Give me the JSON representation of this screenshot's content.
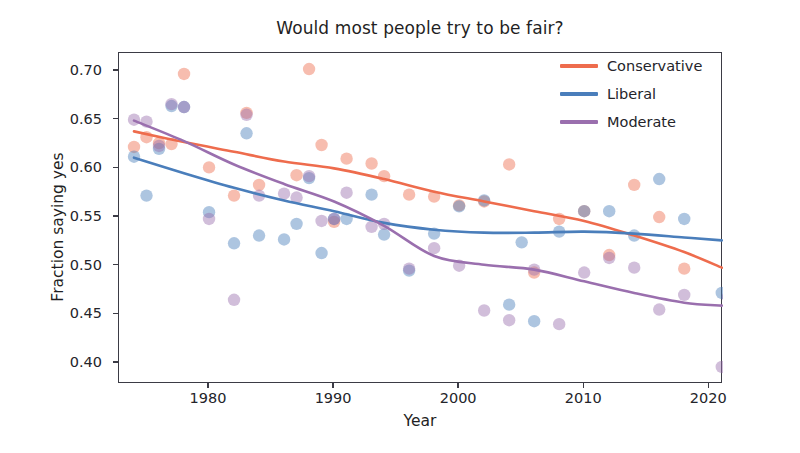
{
  "chart_data": {
    "type": "scatter",
    "title": "Would most people try to be fair?",
    "xlabel": "Year",
    "ylabel": "Fraction saying yes",
    "xlim": [
      1972.8,
      11.0
    ],
    "x_range": [
      1972.8,
      2021.1
    ],
    "ylim": [
      0.3785,
      0.7185
    ],
    "grid": false,
    "legend_position": "upper right",
    "xticks": [
      1980,
      1990,
      2000,
      2010,
      2020
    ],
    "xtick_labels": [
      "1980",
      "1990",
      "2000",
      "2010",
      "2020"
    ],
    "yticks": [
      0.4,
      0.45,
      0.5,
      0.55,
      0.6,
      0.65,
      0.7
    ],
    "ytick_labels": [
      "0.40",
      "0.45",
      "0.50",
      "0.55",
      "0.60",
      "0.65",
      "0.70"
    ],
    "colors": {
      "Conservative": "#ee6c4d",
      "Liberal": "#4a7ebb",
      "Moderate": "#9a6fae"
    },
    "marker_opacity": 0.45,
    "series": [
      {
        "name": "Conservative",
        "color": "#ee6c4d",
        "points": [
          [
            1974,
            0.622
          ],
          [
            1975,
            0.632
          ],
          [
            1976,
            0.626
          ],
          [
            1977,
            0.625
          ],
          [
            1978,
            0.697
          ],
          [
            1980,
            0.601
          ],
          [
            1982,
            0.572
          ],
          [
            1983,
            0.657
          ],
          [
            1984,
            0.583
          ],
          [
            1986,
            0.726
          ],
          [
            1987,
            0.593
          ],
          [
            1988,
            0.702
          ],
          [
            1989,
            0.624
          ],
          [
            1990,
            0.545
          ],
          [
            1991,
            0.61
          ],
          [
            1993,
            0.605
          ],
          [
            1994,
            0.592
          ],
          [
            1996,
            0.573
          ],
          [
            1998,
            0.571
          ],
          [
            2000,
            0.562
          ],
          [
            2002,
            0.566
          ],
          [
            2004,
            0.604
          ],
          [
            2006,
            0.493
          ],
          [
            2008,
            0.548
          ],
          [
            2010,
            0.556
          ],
          [
            2012,
            0.511
          ],
          [
            2014,
            0.583
          ],
          [
            2016,
            0.55
          ],
          [
            2018,
            0.497
          ]
        ],
        "trend": [
          [
            1974,
            0.638
          ],
          [
            1978,
            0.627
          ],
          [
            1982,
            0.617
          ],
          [
            1986,
            0.607
          ],
          [
            1990,
            0.6
          ],
          [
            1994,
            0.589
          ],
          [
            1998,
            0.576
          ],
          [
            2002,
            0.566
          ],
          [
            2006,
            0.556
          ],
          [
            2010,
            0.546
          ],
          [
            2014,
            0.531
          ],
          [
            2018,
            0.514
          ],
          [
            2021,
            0.498
          ]
        ]
      },
      {
        "name": "Liberal",
        "color": "#4a7ebb",
        "points": [
          [
            1974,
            0.612
          ],
          [
            1975,
            0.572
          ],
          [
            1976,
            0.62
          ],
          [
            1977,
            0.664
          ],
          [
            1978,
            0.663
          ],
          [
            1980,
            0.555
          ],
          [
            1982,
            0.523
          ],
          [
            1983,
            0.636
          ],
          [
            1984,
            0.531
          ],
          [
            1986,
            0.527
          ],
          [
            1987,
            0.543
          ],
          [
            1988,
            0.59
          ],
          [
            1989,
            0.513
          ],
          [
            1990,
            0.548
          ],
          [
            1991,
            0.548
          ],
          [
            1993,
            0.573
          ],
          [
            1994,
            0.532
          ],
          [
            1996,
            0.495
          ],
          [
            1998,
            0.533
          ],
          [
            2000,
            0.561
          ],
          [
            2002,
            0.567
          ],
          [
            2004,
            0.46
          ],
          [
            2005,
            0.524
          ],
          [
            2006,
            0.443
          ],
          [
            2008,
            0.535
          ],
          [
            2010,
            0.556
          ],
          [
            2012,
            0.556
          ],
          [
            2014,
            0.531
          ],
          [
            2016,
            0.589
          ],
          [
            2018,
            0.548
          ],
          [
            2021,
            0.472
          ]
        ],
        "trend": [
          [
            1974,
            0.611
          ],
          [
            1978,
            0.595
          ],
          [
            1982,
            0.58
          ],
          [
            1986,
            0.567
          ],
          [
            1990,
            0.556
          ],
          [
            1994,
            0.544
          ],
          [
            1998,
            0.537
          ],
          [
            2002,
            0.534
          ],
          [
            2006,
            0.534
          ],
          [
            2010,
            0.535
          ],
          [
            2014,
            0.533
          ],
          [
            2018,
            0.529
          ],
          [
            2021,
            0.526
          ]
        ]
      },
      {
        "name": "Moderate",
        "color": "#9a6fae",
        "points": [
          [
            1974,
            0.65
          ],
          [
            1975,
            0.648
          ],
          [
            1976,
            0.623
          ],
          [
            1977,
            0.666
          ],
          [
            1978,
            0.663
          ],
          [
            1980,
            0.548
          ],
          [
            1982,
            0.465
          ],
          [
            1983,
            0.655
          ],
          [
            1984,
            0.572
          ],
          [
            1986,
            0.574
          ],
          [
            1987,
            0.57
          ],
          [
            1988,
            0.592
          ],
          [
            1989,
            0.546
          ],
          [
            1990,
            0.548
          ],
          [
            1991,
            0.575
          ],
          [
            1993,
            0.54
          ],
          [
            1994,
            0.543
          ],
          [
            1996,
            0.497
          ],
          [
            1998,
            0.518
          ],
          [
            2000,
            0.5
          ],
          [
            2002,
            0.454
          ],
          [
            2004,
            0.444
          ],
          [
            2006,
            0.496
          ],
          [
            2008,
            0.44
          ],
          [
            2010,
            0.493
          ],
          [
            2012,
            0.508
          ],
          [
            2014,
            0.498
          ],
          [
            2016,
            0.455
          ],
          [
            2018,
            0.47
          ],
          [
            2021,
            0.396
          ],
          [
            2021.5,
            0.468
          ]
        ],
        "trend": [
          [
            1974,
            0.649
          ],
          [
            1978,
            0.628
          ],
          [
            1982,
            0.604
          ],
          [
            1986,
            0.584
          ],
          [
            1990,
            0.566
          ],
          [
            1994,
            0.541
          ],
          [
            1998,
            0.51
          ],
          [
            2002,
            0.501
          ],
          [
            2006,
            0.496
          ],
          [
            2010,
            0.484
          ],
          [
            2014,
            0.472
          ],
          [
            2018,
            0.462
          ],
          [
            2021,
            0.459
          ]
        ]
      }
    ]
  },
  "legend": {
    "items": [
      {
        "label": "Conservative",
        "color": "#ee6c4d"
      },
      {
        "label": "Liberal",
        "color": "#4a7ebb"
      },
      {
        "label": "Moderate",
        "color": "#9a6fae"
      }
    ]
  }
}
